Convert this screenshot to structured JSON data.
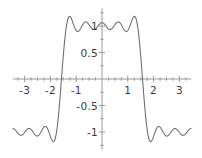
{
  "chart_data": {
    "type": "line",
    "title": "",
    "subtitle": "",
    "xlabel": "",
    "ylabel": "",
    "xlim": [
      -3.45,
      3.45
    ],
    "ylim": [
      -1.33,
      1.33
    ],
    "grid": false,
    "legend": null,
    "annotations": [],
    "x_ticks": [
      -3,
      -2,
      -1,
      1,
      2,
      3
    ],
    "x_tick_labels": [
      "-3",
      "-2",
      "-1",
      "1",
      "2",
      "3"
    ],
    "y_ticks": [
      1,
      0.5,
      -0.5,
      -1
    ],
    "y_tick_labels": [
      "1",
      "0.5",
      "-0.5",
      "-1"
    ],
    "minor_tick_step": 0.25,
    "axis_color": "#9a9a9a",
    "curve_color": "#6b6b6b",
    "background_color": "#ffffff",
    "series": [
      {
        "name": "fourier_partial_sum",
        "formula": "(4/pi)*(cos(x) - cos(3x)/3 + cos(5x)/5 - cos(7x)/7 + cos(9x)/9)",
        "n_terms": 5,
        "harmonics": [
          1,
          3,
          5,
          7,
          9
        ],
        "coefficients": [
          1.2732,
          -0.4244,
          0.2546,
          -0.1819,
          0.1415
        ],
        "x_samples": [
          -3.45,
          -3.2,
          -3.0,
          -2.8,
          -2.6,
          -2.4,
          -2.2,
          -2.0,
          -1.8,
          -1.7,
          -1.6,
          -1.5,
          -1.4,
          -1.2,
          -1.0,
          -0.8,
          -0.6,
          -0.4,
          -0.2,
          0,
          0.2,
          0.4,
          0.6,
          0.8,
          1.0,
          1.2,
          1.4,
          1.5,
          1.6,
          1.7,
          1.8,
          2.0,
          2.2,
          2.4,
          2.6,
          2.8,
          3.0,
          3.2,
          3.45
        ],
        "plateau_high": 1.0,
        "plateau_low": -1.0,
        "overshoot_high": 1.18,
        "overshoot_low": -1.18,
        "transition_x": [
          -1.5708,
          1.5708
        ]
      }
    ]
  },
  "axes": {
    "x_axis_name": "horizontal-axis",
    "y_axis_name": "vertical-axis"
  }
}
